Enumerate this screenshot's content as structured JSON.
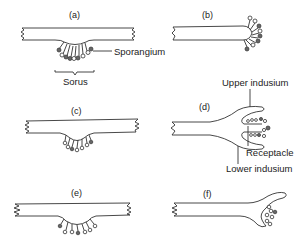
{
  "diagram": {
    "panels": [
      {
        "id": "a",
        "label": "(a)",
        "description": "Sorus on lower surface of leaf blade, sporangia on receptacle"
      },
      {
        "id": "b",
        "label": "(b)",
        "description": "Sporangia at marginal tip of blade"
      },
      {
        "id": "c",
        "label": "(c)",
        "description": "Shallow sunken sorus on lower surface"
      },
      {
        "id": "d",
        "label": "(d)",
        "description": "Marginal sorus with upper and lower indusium and receptacle"
      },
      {
        "id": "e",
        "label": "(e)",
        "description": "Sorus on lower surface with spaced sporangia"
      },
      {
        "id": "f",
        "label": "(f)",
        "description": "Marginal flared blade with sporangia on reflexed margin"
      }
    ],
    "annotations": {
      "sporangium": "Sporangium",
      "sorus": "Sorus",
      "upper_indusium": "Upper indusium",
      "receptacle": "Receptacle",
      "lower_indusium": "Lower indusium"
    }
  }
}
